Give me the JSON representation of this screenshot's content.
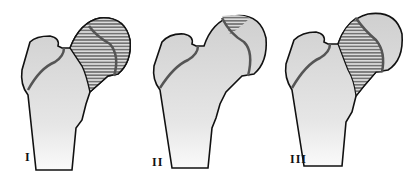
{
  "figure": {
    "colors": {
      "bone_fill": "#d4d4d4",
      "outline": "#111111",
      "hatch": "#333333",
      "physis_line": "#555555"
    },
    "panels": [
      {
        "label": "I",
        "hatched_region": "lateral half of femoral head including neck area"
      },
      {
        "label": "II",
        "hatched_region": "small superior cap of femoral head"
      },
      {
        "label": "III",
        "hatched_region": "femoral neck and medial head region"
      }
    ]
  }
}
